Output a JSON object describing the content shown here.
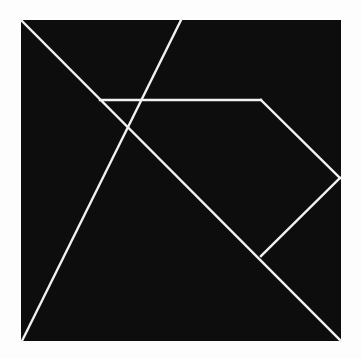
{
  "figure": {
    "title": "Tangram square dissection",
    "type": "geometric-diagram",
    "canvas": {
      "width": 362,
      "height": 358
    },
    "colors": {
      "background": "#fdfdfd",
      "fill": "#0d0d0d",
      "line": "#f2f2f2"
    },
    "line_width": 2.4,
    "square": {
      "label": "outer-square",
      "top_left": [
        21,
        20
      ],
      "top_right": [
        341,
        20
      ],
      "bottom_right": [
        341,
        341
      ],
      "bottom_left": [
        21,
        341
      ]
    },
    "vertices": {
      "top_left": [
        21,
        20
      ],
      "top_edge_midpoint": [
        181,
        20
      ],
      "top_right": [
        341,
        20
      ],
      "left_quarter_point": [
        100,
        100
      ],
      "upper_right_apex": [
        261,
        100
      ],
      "center": [
        180,
        181
      ],
      "right_edge_point": [
        340,
        178
      ],
      "lower_right_point": [
        261,
        256
      ],
      "bottom_left": [
        22,
        341
      ],
      "bottom_right": [
        341,
        341
      ]
    },
    "cut_lines": [
      {
        "name": "main-diagonal",
        "from": [
          21,
          20
        ],
        "to": [
          341,
          341
        ],
        "description": "Diagonal from top-left corner to bottom-right corner"
      },
      {
        "name": "anti-diagonal-half",
        "from": [
          22,
          341
        ],
        "to": [
          181,
          20
        ],
        "description": "Diagonal from bottom-left corner to midpoint of top edge"
      },
      {
        "name": "horizontal-cut",
        "from": [
          100,
          100
        ],
        "to": [
          261,
          100
        ],
        "description": "Horizontal segment joining the main diagonal to the anti-diagonal"
      },
      {
        "name": "upper-right-cut",
        "from": [
          261,
          100
        ],
        "to": [
          340,
          178
        ],
        "description": "Segment from the upper right apex to the right edge"
      },
      {
        "name": "lower-right-cut",
        "from": [
          340,
          178
        ],
        "to": [
          261,
          256
        ],
        "description": "Segment from the right edge back to the main diagonal"
      }
    ],
    "pieces": [
      {
        "name": "large-triangle-left",
        "piece_type": "large triangle"
      },
      {
        "name": "large-triangle-bottom",
        "piece_type": "large triangle"
      },
      {
        "name": "medium-triangle-top",
        "piece_type": "medium triangle"
      },
      {
        "name": "small-triangle-upper",
        "piece_type": "small triangle"
      },
      {
        "name": "small-triangle-lower",
        "piece_type": "small triangle"
      },
      {
        "name": "square-piece",
        "piece_type": "square"
      },
      {
        "name": "parallelogram-piece",
        "piece_type": "parallelogram"
      }
    ],
    "piece_count": 7
  }
}
